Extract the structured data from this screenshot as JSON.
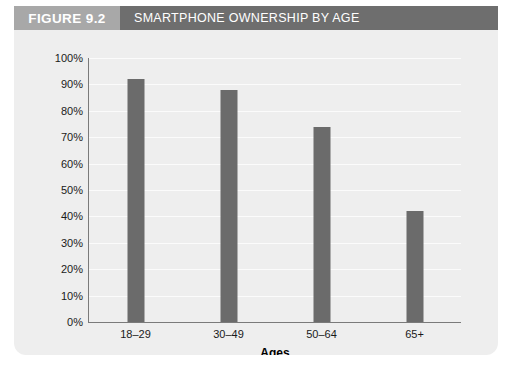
{
  "figure": {
    "number_label": "FIGURE 9.2",
    "title": "SMARTPHONE OWNERSHIP BY AGE",
    "number_block_color": "#a8a8a8",
    "title_block_color": "#6e6e6e",
    "panel_color": "#eeeeee"
  },
  "chart_data": {
    "type": "bar",
    "title": "SMARTPHONE OWNERSHIP BY AGE",
    "categories": [
      "18–29",
      "30–49",
      "50–64",
      "65+"
    ],
    "values": [
      92,
      88,
      74,
      42
    ],
    "xlabel": "Ages",
    "ylabel": "",
    "ylim": [
      0,
      100
    ],
    "yticks": [
      0,
      10,
      20,
      30,
      40,
      50,
      60,
      70,
      80,
      90,
      100
    ],
    "ytick_labels": [
      "0%",
      "10%",
      "20%",
      "30%",
      "40%",
      "50%",
      "60%",
      "70%",
      "80%",
      "90%",
      "100%"
    ],
    "grid": true,
    "legend": false,
    "bar_color": "#6b6b6b",
    "gridline_color": "#fbfbfb",
    "axis_color": "#7a7a7a"
  }
}
